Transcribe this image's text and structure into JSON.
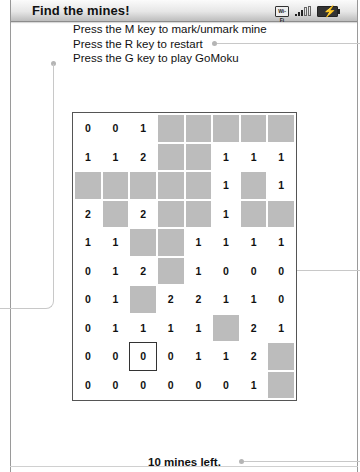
{
  "window": {
    "title": "Find the mines!"
  },
  "status_bar": {
    "wifi_label": "Wi-Fi",
    "signal_icon": "signal-bars-icon",
    "battery_icon": "battery-charging-icon",
    "battery_bolt": "⚡"
  },
  "instructions": [
    "Press the M key to mark/unmark mine",
    "Press the R key to restart",
    "Press the G key to play GoMoku"
  ],
  "board": {
    "columns": 8,
    "rows": 10,
    "hidden_color": "#bcbcbc",
    "selected": {
      "row": 8,
      "col": 2
    },
    "cells": [
      [
        "0",
        "0",
        "1",
        "H",
        "H",
        "H",
        "H",
        "H"
      ],
      [
        "1",
        "1",
        "2",
        "H",
        "H",
        "1",
        "1",
        "1"
      ],
      [
        "H",
        "H",
        "H",
        "H",
        "H",
        "1",
        "H",
        "1"
      ],
      [
        "2",
        "H",
        "2",
        "H",
        "H",
        "1",
        "H",
        "H"
      ],
      [
        "1",
        "1",
        "H",
        "H",
        "1",
        "1",
        "1",
        "1"
      ],
      [
        "0",
        "1",
        "2",
        "H",
        "1",
        "0",
        "0",
        "0"
      ],
      [
        "0",
        "1",
        "H",
        "2",
        "2",
        "1",
        "1",
        "0"
      ],
      [
        "0",
        "1",
        "1",
        "1",
        "1",
        "H",
        "2",
        "1"
      ],
      [
        "0",
        "0",
        "0",
        "0",
        "1",
        "1",
        "2",
        "H"
      ],
      [
        "0",
        "0",
        "0",
        "0",
        "0",
        "0",
        "1",
        "H"
      ]
    ]
  },
  "footer": {
    "mines_left": "10 mines left."
  }
}
